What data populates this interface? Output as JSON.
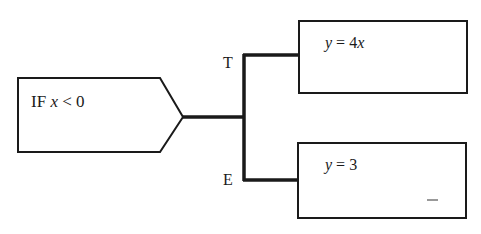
{
  "diagram": {
    "condition": {
      "prefix": "IF",
      "var": "x",
      "rest": " < 0"
    },
    "branches": [
      {
        "label": "T",
        "stmt_var": "y",
        "stmt_op": " = 4",
        "stmt_tail": "x"
      },
      {
        "label": "E",
        "stmt_var": "y",
        "stmt_op": " = 3",
        "stmt_tail": ""
      }
    ]
  }
}
